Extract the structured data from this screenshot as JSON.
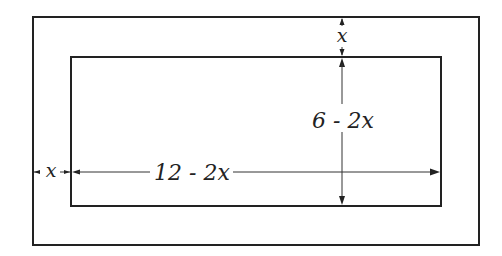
{
  "diagram": {
    "type": "nested-rectangles-dimension",
    "outer_rectangle": {
      "x": 33,
      "y": 17,
      "width": 446,
      "height": 228
    },
    "inner_rectangle": {
      "x": 71,
      "y": 57,
      "width": 370,
      "height": 149
    },
    "labels": {
      "top_margin": "x",
      "left_margin": "x",
      "inner_width": "12 - 2x",
      "inner_height": "6 - 2x"
    },
    "colors": {
      "stroke": "#222222",
      "background": "#ffffff"
    }
  }
}
